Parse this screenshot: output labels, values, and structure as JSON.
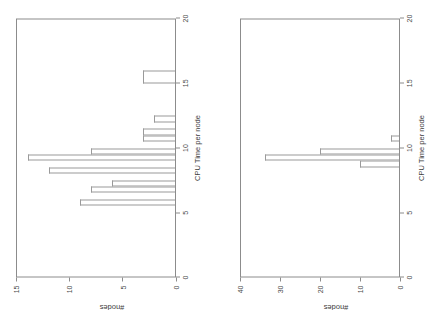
{
  "figure": {
    "background_color": "#ffffff",
    "line_color": "#8c8c8c",
    "text_color": "#3c3c3c",
    "orientation_note": "both panels rendered rotated 90 degrees counter-clockwise"
  },
  "chart_data": [
    {
      "panel": "left",
      "type": "bar",
      "title": "",
      "subtitle": "",
      "xlabel": "CPU Time per node",
      "ylabel": "#nodes",
      "xlim": [
        0,
        20
      ],
      "ylim": [
        0,
        15
      ],
      "xticks": [
        0,
        5,
        10,
        15,
        20
      ],
      "xticklabels": [
        "0",
        "5",
        "10",
        "15",
        "20"
      ],
      "yticks": [
        0,
        5,
        10,
        15
      ],
      "yticklabels": [
        "0",
        "5",
        "10",
        "15"
      ],
      "grid": false,
      "legend": "none",
      "bin_width": 0.5,
      "bins": [
        {
          "x0": 5.5,
          "x1": 6.0,
          "value": 9
        },
        {
          "x0": 6.0,
          "x1": 6.5,
          "value": 0
        },
        {
          "x0": 6.5,
          "x1": 7.0,
          "value": 8
        },
        {
          "x0": 7.0,
          "x1": 7.5,
          "value": 6
        },
        {
          "x0": 7.5,
          "x1": 8.0,
          "value": 0
        },
        {
          "x0": 8.0,
          "x1": 8.5,
          "value": 12
        },
        {
          "x0": 8.5,
          "x1": 9.0,
          "value": 0
        },
        {
          "x0": 9.0,
          "x1": 9.5,
          "value": 14
        },
        {
          "x0": 9.5,
          "x1": 10.0,
          "value": 8
        },
        {
          "x0": 10.0,
          "x1": 10.5,
          "value": 0
        },
        {
          "x0": 10.5,
          "x1": 11.0,
          "value": 3
        },
        {
          "x0": 11.0,
          "x1": 11.5,
          "value": 3
        },
        {
          "x0": 11.5,
          "x1": 12.0,
          "value": 0
        },
        {
          "x0": 12.0,
          "x1": 12.5,
          "value": 2
        },
        {
          "x0": 12.5,
          "x1": 13.0,
          "value": 0
        },
        {
          "x0": 13.0,
          "x1": 13.5,
          "value": 0
        },
        {
          "x0": 13.5,
          "x1": 14.0,
          "value": 0
        },
        {
          "x0": 14.0,
          "x1": 14.5,
          "value": 0
        },
        {
          "x0": 15.0,
          "x1": 16.0,
          "value": 3
        }
      ]
    },
    {
      "panel": "right",
      "type": "bar",
      "title": "",
      "subtitle": "",
      "xlabel": "CPU Time per node",
      "ylabel": "#nodes",
      "xlim": [
        0,
        20
      ],
      "ylim": [
        0,
        40
      ],
      "xticks": [
        0,
        5,
        10,
        15,
        20
      ],
      "xticklabels": [
        "0",
        "5",
        "10",
        "15",
        "20"
      ],
      "yticks": [
        0,
        10,
        20,
        30,
        40
      ],
      "yticklabels": [
        "0",
        "10",
        "20",
        "30",
        "40"
      ],
      "grid": false,
      "legend": "none",
      "bin_width": 0.5,
      "bins": [
        {
          "x0": 8.5,
          "x1": 9.0,
          "value": 10
        },
        {
          "x0": 9.0,
          "x1": 9.5,
          "value": 34
        },
        {
          "x0": 9.5,
          "x1": 10.0,
          "value": 20
        },
        {
          "x0": 10.5,
          "x1": 11.0,
          "value": 2
        }
      ]
    }
  ]
}
